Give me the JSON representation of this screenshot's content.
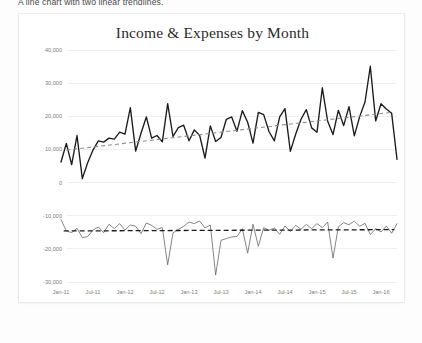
{
  "caption": "A line chart with two linear trendlines.",
  "chart_data": {
    "type": "line",
    "title": "Income & Expenses by Month",
    "xlabel": "",
    "ylabel": "",
    "grid": true,
    "legend": "none",
    "ylim": [
      -30000,
      40000
    ],
    "ytick_values": [
      40000,
      30000,
      20000,
      10000,
      0,
      -10000,
      -20000,
      -30000
    ],
    "ytick_labels": [
      "40,000",
      "30,000",
      "20,000",
      "10,000",
      "0",
      "-10,000",
      "-20,000",
      "-30,000"
    ],
    "xtick_labels": [
      "Jan-11",
      "Jul-11",
      "Jan-12",
      "Jul-12",
      "Jan-13",
      "Jul-13",
      "Jan-14",
      "Jul-14",
      "Jan-15",
      "Jul-15",
      "Jan-16"
    ],
    "xtick_indices": [
      0,
      6,
      12,
      18,
      24,
      30,
      36,
      42,
      48,
      54,
      60
    ],
    "x_count": 64,
    "series": [
      {
        "name": "Income",
        "color": "#1b1b1b",
        "values": [
          6200,
          11800,
          5400,
          14200,
          1200,
          6000,
          9800,
          12600,
          12200,
          13400,
          13100,
          15200,
          14600,
          22600,
          9500,
          14900,
          19800,
          13400,
          14200,
          12300,
          23800,
          13900,
          16600,
          17300,
          12600,
          15900,
          14200,
          7400,
          17100,
          12400,
          13600,
          19100,
          19800,
          15500,
          21700,
          18200,
          11900,
          21200,
          20500,
          15400,
          12600,
          19800,
          22300,
          9400,
          14600,
          19100,
          22000,
          16500,
          15200,
          28600,
          18500,
          14500,
          21800,
          17200,
          22900,
          14100,
          19900,
          24300,
          35100,
          18600,
          23800,
          22200,
          20900,
          7000
        ]
      },
      {
        "name": "Expenses",
        "color": "#5c5c5c",
        "values": [
          -11200,
          -14600,
          -15100,
          -13800,
          -16600,
          -16300,
          -14300,
          -13400,
          -15100,
          -12600,
          -13900,
          -12400,
          -14300,
          -12800,
          -13200,
          -15400,
          -12200,
          -12900,
          -14100,
          -13600,
          -24800,
          -15200,
          -14100,
          -13200,
          -11900,
          -12400,
          -11600,
          -13700,
          -12800,
          -27900,
          -17400,
          -16900,
          -16400,
          -16300,
          -13900,
          -21300,
          -12600,
          -19200,
          -13600,
          -14400,
          -13700,
          -15600,
          -13100,
          -14800,
          -12900,
          -14100,
          -12600,
          -13900,
          -12400,
          -13600,
          -11900,
          -22800,
          -13400,
          -12100,
          -12700,
          -11600,
          -13200,
          -12300,
          -15700,
          -13900,
          -14900,
          -13100,
          -15300,
          -12400
        ]
      }
    ],
    "trendlines": [
      {
        "name": "Income trendline",
        "style": "dashed",
        "color": "#8d8d8d",
        "start_value": 9800,
        "end_value": 21200
      },
      {
        "name": "Expenses trendline",
        "style": "dashed",
        "color": "#1b1b1b",
        "start_value": -14600,
        "end_value": -14200
      }
    ]
  }
}
